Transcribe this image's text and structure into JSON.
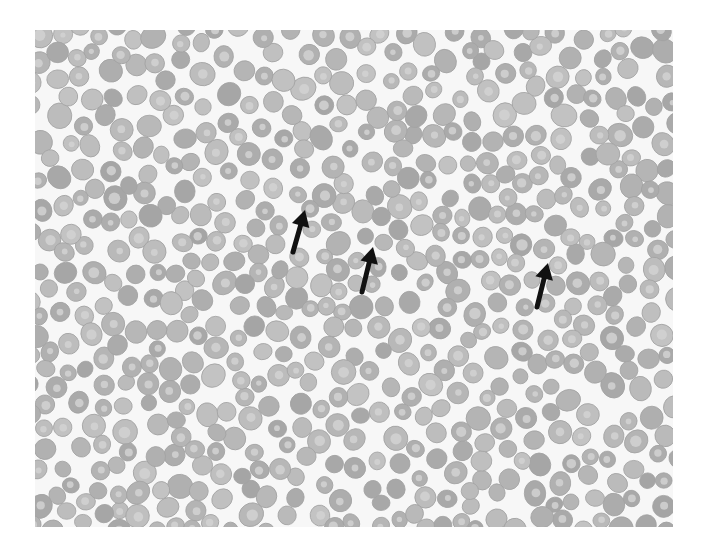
{
  "image": {
    "subject": "peripheral blood smear micrograph",
    "background_color": "#f7f7f7",
    "cell_fill": "#b4b4b4",
    "cell_rim": "#a2a2a2",
    "cell_center": "#d2d2d2",
    "seed": 1337,
    "cell_count": 720,
    "cell_radius_range": [
      8,
      12
    ]
  },
  "arrows": [
    {
      "name": "arrow-1",
      "tip": [
        305,
        210
      ],
      "tail": [
        293,
        252
      ],
      "color": "#111111"
    },
    {
      "name": "arrow-2",
      "tip": [
        373,
        247
      ],
      "tail": [
        362,
        292
      ],
      "color": "#111111"
    },
    {
      "name": "arrow-3",
      "tip": [
        548,
        263
      ],
      "tail": [
        537,
        307
      ],
      "color": "#111111"
    }
  ]
}
